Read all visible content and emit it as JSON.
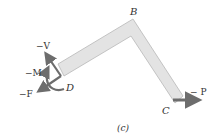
{
  "figure": {
    "caption": "(c)",
    "points": {
      "B": "B",
      "C": "C",
      "D": "D"
    },
    "forces": {
      "shear": "−V",
      "moment": "−M",
      "axial": "−F",
      "load": "− P"
    },
    "colors": {
      "member_fill": "#e3e3e3",
      "member_stroke": "#b8b8b8",
      "arrow": "#6d6d6d",
      "text": "#333333"
    }
  }
}
